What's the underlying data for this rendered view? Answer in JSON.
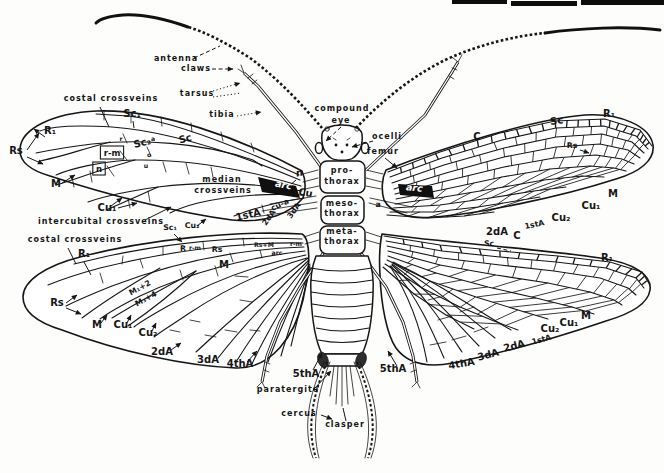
{
  "figure": {
    "style": "black ink line drawing on white paper",
    "ink_color": "#161616",
    "paper_color": "#ffffff"
  },
  "labels": [
    {
      "id": "antenna",
      "t": "antenna",
      "x": 176,
      "y": 61,
      "c": "word",
      "group": "head"
    },
    {
      "id": "claws",
      "t": "claws",
      "x": 196,
      "y": 71,
      "c": "word",
      "group": "legs"
    },
    {
      "id": "tarsus",
      "t": "tarsus",
      "x": 197,
      "y": 96,
      "c": "word",
      "group": "legs"
    },
    {
      "id": "tibia",
      "t": "tibia",
      "x": 222,
      "y": 117,
      "c": "word",
      "group": "legs"
    },
    {
      "id": "compound",
      "t": "compound",
      "x": 342,
      "y": 111,
      "c": "word",
      "group": "head"
    },
    {
      "id": "eye",
      "t": "eye",
      "x": 341,
      "y": 123,
      "c": "word",
      "group": "head"
    },
    {
      "id": "ocelli",
      "t": "ocelli",
      "x": 387,
      "y": 139,
      "c": "word",
      "group": "head"
    },
    {
      "id": "femur",
      "t": "femur",
      "x": 383,
      "y": 154,
      "c": "word",
      "group": "legs"
    },
    {
      "id": "pro",
      "t": "pro-",
      "x": 342,
      "y": 173,
      "c": "word",
      "group": "thorax"
    },
    {
      "id": "pro2",
      "t": "thorax",
      "x": 342,
      "y": 184,
      "c": "word",
      "group": "thorax"
    },
    {
      "id": "meso",
      "t": "meso-",
      "x": 342,
      "y": 206,
      "c": "word",
      "group": "thorax"
    },
    {
      "id": "meso2",
      "t": "thorax",
      "x": 342,
      "y": 216,
      "c": "word",
      "group": "thorax"
    },
    {
      "id": "meta",
      "t": "meta-",
      "x": 342,
      "y": 234,
      "c": "word",
      "group": "thorax"
    },
    {
      "id": "meta2",
      "t": "thorax",
      "x": 342,
      "y": 244,
      "c": "word",
      "group": "thorax"
    },
    {
      "id": "ccv-top",
      "t": "costal crossveins",
      "x": 111,
      "y": 101,
      "c": "word",
      "group": "left-forewing"
    },
    {
      "id": "sc1-fl",
      "t": "Sc₁",
      "x": 132,
      "y": 117,
      "c": "vein",
      "group": "left-forewing"
    },
    {
      "id": "r1-fl",
      "t": "R₁",
      "x": 50,
      "y": 134,
      "c": "vein",
      "group": "left-forewing"
    },
    {
      "id": "rs-fl",
      "t": "Rs",
      "x": 16,
      "y": 154,
      "c": "vein",
      "group": "left-forewing"
    },
    {
      "id": "sc-fl",
      "t": "Sc",
      "x": 186,
      "y": 142,
      "c": "vein",
      "r": -14,
      "group": "left-forewing"
    },
    {
      "id": "sc2-fl",
      "t": "Sc₂",
      "x": 143,
      "y": 146,
      "c": "vein",
      "r": -14,
      "group": "left-forewing"
    },
    {
      "id": "a-fl",
      "t": "a",
      "x": 153,
      "y": 141,
      "c": "tiny",
      "group": "left-forewing"
    },
    {
      "id": "o-fl",
      "t": "o",
      "x": 149,
      "y": 157,
      "c": "tiny",
      "group": "left-forewing"
    },
    {
      "id": "u-fl",
      "t": "u",
      "x": 146,
      "y": 168,
      "c": "tiny",
      "group": "left-forewing"
    },
    {
      "id": "r-fl",
      "t": "r",
      "x": 121,
      "y": 141,
      "c": "tiny",
      "group": "left-forewing"
    },
    {
      "id": "rm-fl",
      "t": "r-m",
      "x": 112,
      "y": 156,
      "c": "box",
      "group": "left-forewing"
    },
    {
      "id": "n-fl",
      "t": "n",
      "x": 99,
      "y": 172,
      "c": "box",
      "group": "left-forewing"
    },
    {
      "id": "m-fl",
      "t": "M",
      "x": 56,
      "y": 187,
      "c": "vein",
      "group": "left-forewing"
    },
    {
      "id": "median1",
      "t": "median",
      "x": 222,
      "y": 182,
      "c": "word",
      "group": "left-forewing"
    },
    {
      "id": "median2",
      "t": "crossveins",
      "x": 223,
      "y": 193,
      "c": "word",
      "group": "left-forewing"
    },
    {
      "id": "cu1-fl",
      "t": "Cu₁",
      "x": 107,
      "y": 211,
      "c": "vein",
      "group": "left-forewing"
    },
    {
      "id": "icv",
      "t": "intercubital crossveins",
      "x": 101,
      "y": 224,
      "c": "word",
      "group": "left-forewing"
    },
    {
      "id": "sc1-lo",
      "t": "Sc₁",
      "x": 170,
      "y": 230,
      "c": "vein-sm",
      "group": "left-hindwing"
    },
    {
      "id": "cu2-fl",
      "t": "Cu₂",
      "x": 192,
      "y": 228,
      "c": "vein-sm",
      "group": "left-forewing"
    },
    {
      "id": "firsta-fl",
      "t": "1stA",
      "x": 249,
      "y": 218,
      "c": "vein",
      "r": -12,
      "group": "left-forewing"
    },
    {
      "id": "cua-fl",
      "t": "cu-a",
      "x": 281,
      "y": 207,
      "c": "vein-sm",
      "r": -26,
      "group": "left-forewing"
    },
    {
      "id": "2da-fl",
      "t": "2dA",
      "x": 271,
      "y": 219,
      "c": "vein-sm",
      "r": -55,
      "group": "left-forewing"
    },
    {
      "id": "3da-fl",
      "t": "3dA",
      "x": 296,
      "y": 212,
      "c": "vein-sm",
      "r": -55,
      "group": "left-forewing"
    },
    {
      "id": "n-it",
      "t": "n",
      "x": 300,
      "y": 176,
      "c": "veinit",
      "r": -12,
      "group": "left-forewing"
    },
    {
      "id": "arc-l",
      "t": "arc",
      "x": 283,
      "y": 188,
      "c": "inv",
      "r": 10,
      "group": "left-forewing"
    },
    {
      "id": "cu-l",
      "t": "Cu",
      "x": 305,
      "y": 196,
      "c": "vein",
      "r": 10,
      "group": "left-forewing"
    },
    {
      "id": "ccv-low",
      "t": "costal crossveins",
      "x": 75,
      "y": 242,
      "c": "word",
      "group": "left-hindwing"
    },
    {
      "id": "r1-hl",
      "t": "R₁",
      "x": 84,
      "y": 257,
      "c": "vein",
      "group": "left-hindwing"
    },
    {
      "id": "r-hl",
      "t": "R",
      "x": 183,
      "y": 251,
      "c": "vein-sm",
      "group": "left-hindwing"
    },
    {
      "id": "rm-hl",
      "t": "r-m",
      "x": 195,
      "y": 250,
      "c": "tiny",
      "group": "left-hindwing"
    },
    {
      "id": "rs-hl",
      "t": "Rs",
      "x": 217,
      "y": 252,
      "c": "vein-sm",
      "group": "left-hindwing"
    },
    {
      "id": "m-hl",
      "t": "M",
      "x": 224,
      "y": 268,
      "c": "vein",
      "group": "left-hindwing"
    },
    {
      "id": "rs-hl2",
      "t": "Rs",
      "x": 57,
      "y": 306,
      "c": "vein",
      "group": "left-hindwing"
    },
    {
      "id": "m-hl2",
      "t": "M",
      "x": 97,
      "y": 328,
      "c": "vein",
      "group": "left-hindwing"
    },
    {
      "id": "cu1-hl",
      "t": "Cu₁",
      "x": 123,
      "y": 328,
      "c": "vein",
      "group": "left-hindwing"
    },
    {
      "id": "cu2-hl",
      "t": "Cu₂",
      "x": 148,
      "y": 336,
      "c": "vein",
      "group": "left-hindwing"
    },
    {
      "id": "m12",
      "t": "M₁+2",
      "x": 141,
      "y": 290,
      "c": "vein-sm",
      "r": -28,
      "group": "left-hindwing"
    },
    {
      "id": "m34",
      "t": "M₃+4",
      "x": 147,
      "y": 301,
      "c": "vein-sm",
      "r": -28,
      "group": "left-hindwing"
    },
    {
      "id": "2da-hl",
      "t": "2dA",
      "x": 162,
      "y": 355,
      "c": "vein",
      "group": "left-hindwing"
    },
    {
      "id": "3da-hl",
      "t": "3dA",
      "x": 208,
      "y": 363,
      "c": "vein",
      "group": "left-hindwing"
    },
    {
      "id": "4tha-hl",
      "t": "4thA",
      "x": 240,
      "y": 367,
      "c": "vein",
      "group": "left-hindwing"
    },
    {
      "id": "5tha-hl",
      "t": "5thA",
      "x": 306,
      "y": 377,
      "c": "vein",
      "group": "left-hindwing"
    },
    {
      "id": "rsm-t",
      "t": "Rs+M",
      "x": 264,
      "y": 247,
      "c": "tiny",
      "group": "left-hindwing"
    },
    {
      "id": "arc-t",
      "t": "arc",
      "x": 277,
      "y": 255,
      "c": "tiny",
      "group": "left-hindwing"
    },
    {
      "id": "rm-t2",
      "t": "r-m",
      "x": 296,
      "y": 246,
      "c": "tiny",
      "group": "left-hindwing"
    },
    {
      "id": "a-r",
      "t": "a",
      "x": 378,
      "y": 207,
      "c": "vein-sm",
      "group": "right-forewing"
    },
    {
      "id": "arc-r",
      "t": "arc",
      "x": 414,
      "y": 191,
      "c": "inv",
      "r": 6,
      "group": "right-forewing"
    },
    {
      "id": "c-fr",
      "t": "C",
      "x": 477,
      "y": 140,
      "c": "vein",
      "group": "right-forewing"
    },
    {
      "id": "sc-fr",
      "t": "Sc",
      "x": 557,
      "y": 124,
      "c": "vein",
      "r": -8,
      "group": "right-forewing"
    },
    {
      "id": "r1-fr",
      "t": "R₁",
      "x": 609,
      "y": 117,
      "c": "vein",
      "group": "right-forewing"
    },
    {
      "id": "rs-fr",
      "t": "Rs",
      "x": 572,
      "y": 148,
      "c": "vein-sm",
      "group": "right-forewing"
    },
    {
      "id": "m-fr",
      "t": "M",
      "x": 613,
      "y": 197,
      "c": "vein",
      "group": "right-forewing"
    },
    {
      "id": "cu1-fr",
      "t": "Cu₁",
      "x": 591,
      "y": 209,
      "c": "vein",
      "group": "right-forewing"
    },
    {
      "id": "cu2-fr",
      "t": "Cu₂",
      "x": 561,
      "y": 221,
      "c": "vein",
      "group": "right-forewing"
    },
    {
      "id": "firsta-fr",
      "t": "1stA",
      "x": 535,
      "y": 227,
      "c": "vein-sm",
      "r": -12,
      "group": "right-forewing"
    },
    {
      "id": "2da-fr",
      "t": "2dA",
      "x": 497,
      "y": 235,
      "c": "vein",
      "group": "right-forewing"
    },
    {
      "id": "c-hr",
      "t": "C",
      "x": 517,
      "y": 239,
      "c": "vein",
      "group": "right-hindwing"
    },
    {
      "id": "sc-hr",
      "t": "Sc",
      "x": 489,
      "y": 246,
      "c": "vein-sm",
      "group": "right-hindwing"
    },
    {
      "id": "r1-hr",
      "t": "R₁",
      "x": 607,
      "y": 261,
      "c": "vein",
      "group": "right-hindwing"
    },
    {
      "id": "m-hr",
      "t": "M",
      "x": 586,
      "y": 319,
      "c": "vein",
      "group": "right-hindwing"
    },
    {
      "id": "cu1-hr",
      "t": "Cu₁",
      "x": 569,
      "y": 326,
      "c": "vein",
      "group": "right-hindwing"
    },
    {
      "id": "cu2-hr",
      "t": "Cu₂",
      "x": 550,
      "y": 332,
      "c": "vein",
      "group": "right-hindwing"
    },
    {
      "id": "firsta-hr",
      "t": "1stA",
      "x": 542,
      "y": 342,
      "c": "vein-sm",
      "r": -15,
      "group": "right-hindwing"
    },
    {
      "id": "2da-hr",
      "t": "2dA",
      "x": 515,
      "y": 349,
      "c": "vein",
      "r": -15,
      "group": "right-hindwing"
    },
    {
      "id": "3da-hr",
      "t": "3dA",
      "x": 489,
      "y": 358,
      "c": "vein",
      "r": -15,
      "group": "right-hindwing"
    },
    {
      "id": "4tha-hr",
      "t": "4thA",
      "x": 462,
      "y": 367,
      "c": "vein",
      "r": -10,
      "group": "right-hindwing"
    },
    {
      "id": "5tha-r",
      "t": "5thA",
      "x": 393,
      "y": 372,
      "c": "vein",
      "group": "right-hindwing"
    },
    {
      "id": "partg",
      "t": "paratergite",
      "x": 288,
      "y": 392,
      "c": "word",
      "group": "abdomen"
    },
    {
      "id": "cercus",
      "t": "cercus",
      "x": 299,
      "y": 416,
      "c": "word",
      "group": "abdomen"
    },
    {
      "id": "clasper",
      "t": "clasper",
      "x": 345,
      "y": 427,
      "c": "word",
      "group": "abdomen"
    }
  ]
}
